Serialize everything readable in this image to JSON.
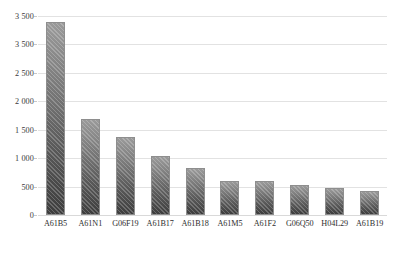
{
  "chart_data": {
    "type": "bar",
    "title": "",
    "subtitle": "",
    "xlabel": "",
    "ylabel": "",
    "categories": [
      "A61B5",
      "A61N1",
      "G06F19",
      "A61B17",
      "A61B18",
      "A61M5",
      "A61F2",
      "G06Q50",
      "H04L29",
      "A61B19"
    ],
    "values": [
      3400,
      1680,
      1380,
      1030,
      820,
      600,
      600,
      520,
      480,
      420
    ],
    "ylim": [
      0,
      3500
    ],
    "ytick_values": [
      3500,
      3000,
      2500,
      2000,
      1500,
      1000,
      500,
      0
    ],
    "ytick_labels": [
      "3 500",
      "3 500",
      "2 500",
      "2 000",
      "1 500",
      "1 000",
      "500",
      "0"
    ],
    "grid": true,
    "legend": null,
    "legend_position": "none",
    "series": [
      {
        "name": "Patent count",
        "values": [
          3400,
          1680,
          1380,
          1030,
          820,
          600,
          600,
          520,
          480,
          420
        ]
      }
    ],
    "bar_color": "#6e6e6e",
    "grid_color": "#e2e2e2"
  }
}
